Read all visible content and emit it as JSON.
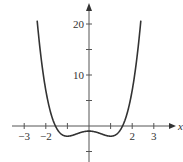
{
  "chart_data": {
    "type": "line",
    "title": "",
    "xlabel": "x",
    "ylabel": "y",
    "function": "x^4 - 2x^2 - 1",
    "xlim": [
      -3.5,
      3.4
    ],
    "ylim": [
      -6.5,
      24
    ],
    "x_ticks": [
      -3,
      -2,
      -1,
      0,
      1,
      2,
      3
    ],
    "x_tick_labels": [
      "-3",
      "-2",
      "",
      "",
      "",
      "2",
      "3"
    ],
    "y_ticks": [
      -5,
      5,
      10,
      15,
      20
    ],
    "y_tick_labels": [
      "",
      "",
      "10",
      "",
      "20"
    ],
    "grid": false,
    "series": [
      {
        "name": "f(x)",
        "x": [
          -2.4,
          -2.2,
          -2.0,
          -1.8,
          -1.6,
          -1.4,
          -1.2,
          -1.0,
          -0.8,
          -0.6,
          -0.4,
          -0.2,
          0.0,
          0.2,
          0.4,
          0.6,
          0.8,
          1.0,
          1.2,
          1.4,
          1.6,
          1.8,
          2.0,
          2.2,
          2.4
        ],
        "values": [
          20.7,
          12.7,
          7.0,
          3.0,
          0.4,
          -1.1,
          -1.8,
          -2.0,
          -1.9,
          -1.6,
          -1.3,
          -1.1,
          -1.0,
          -1.1,
          -1.3,
          -1.6,
          -1.9,
          -2.0,
          -1.8,
          -1.1,
          0.4,
          3.0,
          7.0,
          12.7,
          20.7
        ]
      }
    ]
  }
}
